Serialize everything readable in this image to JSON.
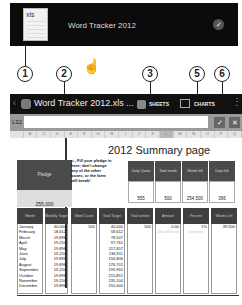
{
  "notification": {
    "thumb_ext": "xls",
    "title": "Word Tracker 2012",
    "check_icon": "checkmark-icon"
  },
  "callouts": [
    "1",
    "2",
    "3",
    "5",
    "6"
  ],
  "gesture_icon": "tap-hand-icon",
  "toolbar": {
    "back": "‹",
    "title": "Word Tracker 2012.xls ...",
    "sheets": "SHEETS",
    "charts": "CHARTS",
    "more": "⋮"
  },
  "formula_bar": {
    "cell_ref": "L32",
    "value": "",
    "ok": "✓",
    "cancel": "✕"
  },
  "columns": [
    "",
    "B",
    "C",
    "D",
    "E",
    "F",
    "G",
    "H",
    "I",
    "J",
    "K",
    "L",
    "M",
    "N",
    "O",
    "P",
    "Q"
  ],
  "sheet": {
    "title": "2012 Summary page",
    "pledge_label": "Pledge",
    "pledge_value": "255,000",
    "note": "<-- Fill your pledge in here; don't change any of the other boxes, or the form will break!",
    "stats": [
      {
        "label": "Daily Quota",
        "value": "555"
      },
      {
        "label": "Total words",
        "value": "500"
      },
      {
        "label": "Words left",
        "value": "254,500"
      },
      {
        "label": "Days left",
        "value": "366"
      }
    ],
    "table_headers": [
      "Month",
      "Monthly Target",
      "Word Count",
      "Goal Target",
      "Total written",
      "Amount ahead/behind",
      "Percent complete",
      "Words Left"
    ],
    "months": [
      "January",
      "February",
      "March",
      "April",
      "May",
      "June",
      "July",
      "August",
      "September",
      "October",
      "November",
      "December"
    ],
    "monthly_target": [
      "40,000",
      "18,612",
      "19,896",
      "19,254",
      "19,896",
      "19,254",
      "19,896",
      "19,896",
      "19,254",
      "19,896",
      "19,254",
      "19,896"
    ],
    "word_count": [
      "500",
      "",
      "",
      "",
      "",
      "",
      "",
      "",
      "",
      "",
      "",
      ""
    ],
    "goal_target": [
      "40,000",
      "58,612",
      "78,507",
      "97,761",
      "117,657",
      "136,911",
      "156,806",
      "176,701",
      "195,955",
      "215,851",
      "235,104",
      "255,000"
    ],
    "total_written": [
      "500"
    ],
    "amount_ahead": [
      "0.00"
    ],
    "percent_complete": [
      "1%"
    ],
    "words_left": [
      "39,500"
    ]
  }
}
